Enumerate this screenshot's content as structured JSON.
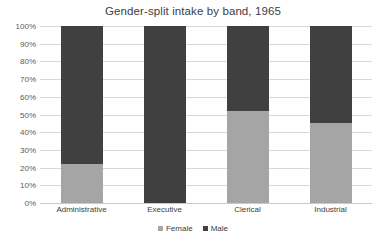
{
  "chart_data": {
    "type": "bar",
    "subtype": "stacked-100-percent",
    "title": "Gender-split intake by band, 1965",
    "xlabel": "",
    "ylabel": "",
    "ylim": [
      0,
      100
    ],
    "ytick_labels": [
      "100%",
      "90%",
      "80%",
      "70%",
      "60%",
      "50%",
      "40%",
      "30%",
      "20%",
      "10%",
      "0%"
    ],
    "ytick_values": [
      100,
      90,
      80,
      70,
      60,
      50,
      40,
      30,
      20,
      10,
      0
    ],
    "grid": true,
    "legend_position": "bottom-center",
    "categories": [
      "Administrative",
      "Executive",
      "Clerical",
      "Industrial"
    ],
    "series": [
      {
        "name": "Female",
        "color": "#a5a5a5",
        "values": [
          22,
          0,
          52,
          45
        ]
      },
      {
        "name": "Male",
        "color": "#404040",
        "values": [
          78,
          100,
          48,
          55
        ]
      }
    ]
  },
  "legend": {
    "items": [
      {
        "label": "Female",
        "color": "#a5a5a5"
      },
      {
        "label": "Male",
        "color": "#404040"
      }
    ]
  }
}
